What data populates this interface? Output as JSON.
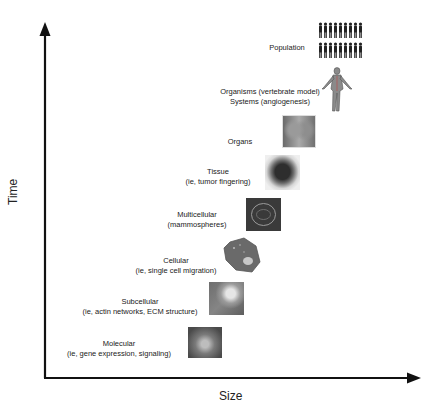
{
  "diagram": {
    "axes": {
      "y_label": "Time",
      "x_label": "Size"
    },
    "levels": [
      {
        "id": "population",
        "line1": "Population",
        "line2": "",
        "icon": "population-icon"
      },
      {
        "id": "organisms",
        "line1": "Organisms (vertebrate model)",
        "line2": "Systems (angiogenesis)",
        "icon": "human-figure-icon"
      },
      {
        "id": "organs",
        "line1": "Organs",
        "line2": "",
        "icon": "organ-image-icon"
      },
      {
        "id": "tissue",
        "line1": "Tissue",
        "line2": "(ie, tumor fingering)",
        "icon": "tissue-image-icon"
      },
      {
        "id": "multicellular",
        "line1": "Multicellular",
        "line2": "(mammospheres)",
        "icon": "mammosphere-image-icon"
      },
      {
        "id": "cellular",
        "line1": "Cellular",
        "line2": "(ie, single cell migration)",
        "icon": "cell-image-icon"
      },
      {
        "id": "subcellular",
        "line1": "Subcellular",
        "line2": "(ie, actin networks, ECM structure)",
        "icon": "subcellular-image-icon"
      },
      {
        "id": "molecular",
        "line1": "Molecular",
        "line2": "(ie, gene expression, signaling)",
        "icon": "molecular-image-icon"
      }
    ],
    "colors": {
      "axis": "#111111",
      "text": "#222222",
      "photo_dark": "#3a3a3a",
      "photo_mid": "#7a7a7a"
    }
  }
}
